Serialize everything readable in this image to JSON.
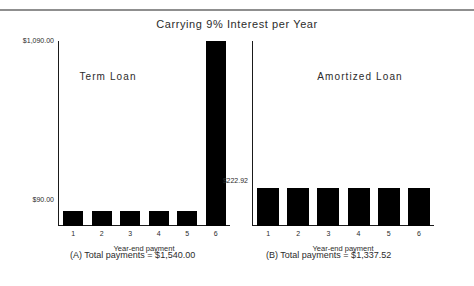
{
  "figure": {
    "title": "Carrying 9% Interest per Year"
  },
  "panels": {
    "left": {
      "label": "Term  Loan",
      "xlabel": "Year-end payment",
      "caption": "(A) Total payments = $1,540.00",
      "yticks": [
        "$1,090.00",
        "$90.00"
      ],
      "xticks": [
        "1",
        "2",
        "3",
        "4",
        "5",
        "6"
      ]
    },
    "right": {
      "label": "Amortized  Loan",
      "xlabel": "Year-end payment",
      "caption": "(B) Total payments = $1,337.52",
      "yticks": [
        "$222.92"
      ],
      "xticks": [
        "1",
        "2",
        "3",
        "4",
        "5",
        "6"
      ]
    }
  },
  "chart_data": [
    {
      "type": "bar",
      "title": "Term Loan",
      "subtitle": "Carrying 9% Interest per Year",
      "categories": [
        "1",
        "2",
        "3",
        "4",
        "5",
        "6"
      ],
      "values": [
        90.0,
        90.0,
        90.0,
        90.0,
        90.0,
        1090.0
      ],
      "xlabel": "Year-end payment",
      "ylabel": "",
      "ylim": [
        0,
        1090
      ],
      "ytick_values": [
        90.0,
        1090.0
      ],
      "ytick_labels": [
        "$90.00",
        "$1,090.00"
      ],
      "grid": false,
      "legend": "none",
      "bar_color": "#000000",
      "annotation": "(A) Total payments = $1,540.00",
      "total": 1540.0
    },
    {
      "type": "bar",
      "title": "Amortized Loan",
      "subtitle": "Carrying 9% Interest per Year",
      "categories": [
        "1",
        "2",
        "3",
        "4",
        "5",
        "6"
      ],
      "values": [
        222.92,
        222.92,
        222.92,
        222.92,
        222.92,
        222.92
      ],
      "xlabel": "Year-end payment",
      "ylabel": "",
      "ylim": [
        0,
        1090
      ],
      "ytick_values": [
        222.92
      ],
      "ytick_labels": [
        "$222.92"
      ],
      "grid": false,
      "legend": "none",
      "bar_color": "#000000",
      "annotation": "(B) Total payments = $1,337.52",
      "total": 1337.52
    }
  ]
}
